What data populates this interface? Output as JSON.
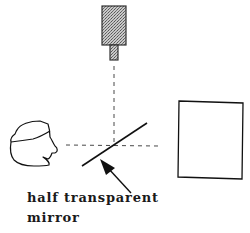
{
  "diagram": {
    "components": [
      {
        "id": "camera",
        "kind": "camera",
        "position": "top-center"
      },
      {
        "id": "head",
        "kind": "human-head-profile",
        "position": "left"
      },
      {
        "id": "mirror",
        "kind": "half-transparent-mirror",
        "position": "center"
      },
      {
        "id": "monitor",
        "kind": "display-rectangle",
        "position": "right"
      }
    ],
    "annotation": {
      "line1": "half transparent",
      "line2": "mirror"
    },
    "colors": {
      "stroke": "#1a1a1a",
      "camera_fill": "#a8a8a8",
      "background": "#ffffff"
    }
  }
}
